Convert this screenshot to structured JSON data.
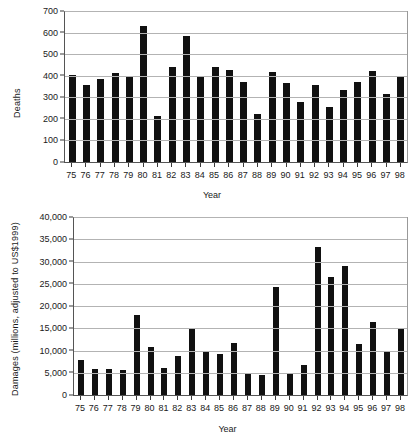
{
  "figure": {
    "background": "#ffffff",
    "bar_color": "#111111",
    "grid_color": "#b3b3b3",
    "axis_color": "#555555"
  },
  "chart_data": [
    {
      "type": "bar",
      "id": "deaths-chart",
      "title": "",
      "xlabel": "Year",
      "ylabel": "Deaths",
      "ylim": [
        0,
        700
      ],
      "ytick_step": 100,
      "ytick_labels": [
        "0",
        "100",
        "200",
        "300",
        "400",
        "500",
        "600",
        "700"
      ],
      "grid": true,
      "grid_axis": "y",
      "legend": "none",
      "categories": [
        "75",
        "76",
        "77",
        "78",
        "79",
        "80",
        "81",
        "82",
        "83",
        "84",
        "85",
        "86",
        "87",
        "88",
        "89",
        "90",
        "91",
        "92",
        "93",
        "94",
        "95",
        "96",
        "97",
        "98"
      ],
      "values": [
        410,
        363,
        388,
        420,
        402,
        640,
        218,
        445,
        590,
        402,
        445,
        432,
        375,
        225,
        423,
        372,
        281,
        361,
        259,
        340,
        378,
        426,
        318,
        405
      ]
    },
    {
      "type": "bar",
      "id": "damages-chart",
      "title": "",
      "xlabel": "Year",
      "ylabel": "Damages (millions, adjusted to US$1999)",
      "ylim": [
        0,
        40000
      ],
      "ytick_step": 5000,
      "ytick_labels": [
        "0",
        "5,000",
        "10,000",
        "15,000",
        "20,000",
        "25,000",
        "30,000",
        "35,000",
        "40,000"
      ],
      "grid": true,
      "grid_axis": "y",
      "legend": "none",
      "categories": [
        "75",
        "76",
        "77",
        "78",
        "79",
        "80",
        "81",
        "82",
        "83",
        "84",
        "85",
        "86",
        "87",
        "88",
        "89",
        "90",
        "91",
        "92",
        "93",
        "94",
        "95",
        "96",
        "97",
        "98"
      ],
      "values": [
        8000,
        6000,
        5800,
        5700,
        18200,
        10800,
        6100,
        8900,
        14900,
        9700,
        9300,
        11800,
        4900,
        4600,
        24600,
        5000,
        6900,
        33600,
        26800,
        29300,
        11700,
        16600,
        10100,
        15000
      ]
    }
  ]
}
